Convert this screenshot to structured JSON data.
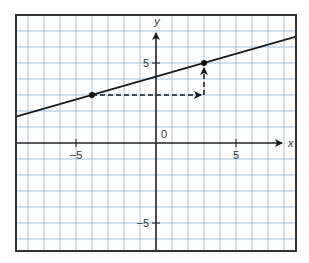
{
  "chart_data": {
    "type": "line",
    "title": "",
    "xlabel": "x",
    "ylabel": "y",
    "xlim": [
      -8.75,
      8.75
    ],
    "ylim": [
      -6.75,
      8
    ],
    "grid": true,
    "grid_step": 1,
    "origin_label": "0",
    "x_ticks": [
      {
        "value": -5,
        "label": "−5"
      },
      {
        "value": 5,
        "label": "5"
      }
    ],
    "y_ticks": [
      {
        "value": 5,
        "label": "5"
      },
      {
        "value": -5,
        "label": "−5"
      }
    ],
    "series": [
      {
        "name": "line",
        "slope": 0.2857,
        "intercept": 4.142857,
        "through": [
          [
            -4,
            3
          ],
          [
            3,
            5
          ]
        ]
      }
    ],
    "points": [
      {
        "x": -4,
        "y": 3
      },
      {
        "x": 3,
        "y": 5
      }
    ],
    "annotations": [
      {
        "type": "dashed-arrow",
        "from": [
          -4,
          3
        ],
        "to": [
          3,
          3
        ],
        "meaning": "run = 7"
      },
      {
        "type": "dashed-arrow",
        "from": [
          3,
          3
        ],
        "to": [
          3,
          5
        ],
        "meaning": "rise = 2"
      }
    ],
    "colors": {
      "grid": "#a9c0da",
      "line": "#1a1a1a",
      "axis": "#222222"
    }
  }
}
